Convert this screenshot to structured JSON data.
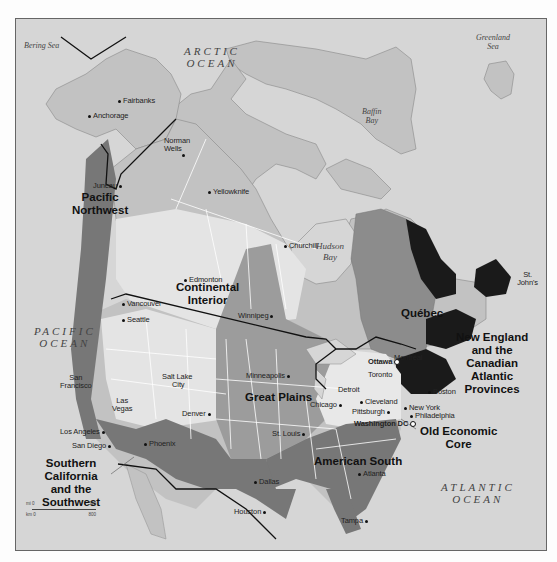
{
  "map": {
    "colors": {
      "ocean": "#d6d6d6",
      "land_base": "#c2c2c2",
      "light_region": "#e4e4e4",
      "medium_region": "#9c9c9c",
      "quebec": "#8c8c8c",
      "dark_region": "#777777",
      "darkest_region": "#1a1a1a",
      "border_line": "#ffffff",
      "national_border": "#111111"
    },
    "water_bodies": {
      "bering_sea": "Bering Sea",
      "arctic_ocean_1": "ARCTIC",
      "arctic_ocean_2": "OCEAN",
      "greenland_sea_1": "Greenland",
      "greenland_sea_2": "Sea",
      "baffin_bay_1": "Baffin",
      "baffin_bay_2": "Bay",
      "hudson_bay_1": "Hudson",
      "hudson_bay_2": "Bay",
      "pacific_ocean_1": "PACIFIC",
      "pacific_ocean_2": "OCEAN",
      "atlantic_ocean_1": "ATLANTIC",
      "atlantic_ocean_2": "OCEAN"
    },
    "regions": {
      "pacific_northwest_1": "Pacific",
      "pacific_northwest_2": "Northwest",
      "continental_interior_1": "Continental",
      "continental_interior_2": "Interior",
      "quebec": "Québec",
      "new_england_1": "New England",
      "new_england_2": "and the",
      "new_england_3": "Canadian",
      "new_england_4": "Atlantic",
      "new_england_5": "Provinces",
      "great_plains": "Great Plains",
      "old_economic_core_1": "Old Economic",
      "old_economic_core_2": "Core",
      "american_south": "American South",
      "socal_1": "Southern",
      "socal_2": "California",
      "socal_3": "and the",
      "socal_4": "Southwest"
    },
    "cities": {
      "fairbanks": "Fairbanks",
      "anchorage": "Anchorage",
      "norman_wells_1": "Norman",
      "norman_wells_2": "Wells",
      "yellowknife": "Yellowknife",
      "juneau": "Juneau",
      "churchill": "Churchill",
      "st_johns_1": "St.",
      "st_johns_2": "John's",
      "edmonton": "Edmonton",
      "vancouver": "Vancouver",
      "seattle": "Seattle",
      "winnipeg": "Winnipeg",
      "ottawa": "Ottawa",
      "montreal": "Montréal",
      "toronto": "Toronto",
      "boston": "Boston",
      "san_francisco_1": "San",
      "san_francisco_2": "Francisco",
      "salt_lake_1": "Salt Lake",
      "salt_lake_2": "City",
      "minneapolis": "Minneapolis",
      "detroit": "Detroit",
      "cleveland": "Cleveland",
      "new_york": "New York",
      "philadelphia": "Philadelphia",
      "pittsburgh": "Pittsburgh",
      "chicago": "Chicago",
      "las_vegas_1": "Las",
      "las_vegas_2": "Vegas",
      "denver": "Denver",
      "los_angeles": "Los Angeles",
      "san_diego": "San Diego",
      "phoenix": "Phoenix",
      "st_louis": "St. Louis",
      "washington": "Washington DC",
      "atlanta": "Atlanta",
      "dallas": "Dallas",
      "houston": "Houston",
      "tampa": "Tampa"
    },
    "scale": {
      "mi_label": "mi 0",
      "mi_max": "500",
      "km_label": "km 0",
      "km_max": "800"
    }
  }
}
